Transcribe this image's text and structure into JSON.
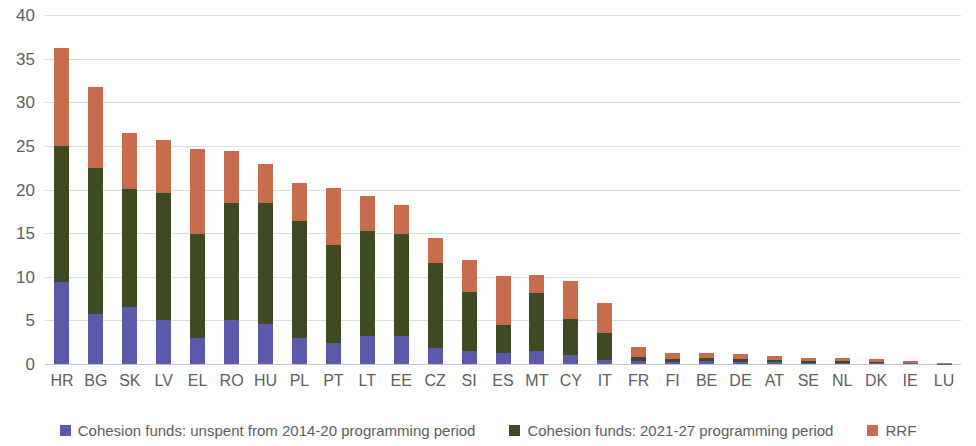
{
  "chart_data": {
    "type": "bar",
    "stacked": true,
    "title": "",
    "subtitle": "",
    "xlabel": "",
    "ylabel": "",
    "ylim": [
      0,
      40
    ],
    "yticks": [
      0,
      5,
      10,
      15,
      20,
      25,
      30,
      35,
      40
    ],
    "ytick_labels": [
      "0",
      "5",
      "10",
      "15",
      "20",
      "25",
      "30",
      "35",
      "40"
    ],
    "grid": true,
    "legend_position": "bottom",
    "categories": [
      "HR",
      "BG",
      "SK",
      "LV",
      "EL",
      "RO",
      "HU",
      "PL",
      "PT",
      "LT",
      "EE",
      "CZ",
      "SI",
      "ES",
      "MT",
      "CY",
      "IT",
      "FR",
      "FI",
      "BE",
      "DE",
      "AT",
      "SE",
      "NL",
      "DK",
      "IE",
      "LU"
    ],
    "series": [
      {
        "name": "Cohesion funds: unspent from 2014-20 programming period",
        "color": "#5c5aa8",
        "values": [
          9.4,
          5.7,
          6.5,
          5.1,
          3.0,
          5.0,
          4.6,
          3.0,
          2.4,
          3.2,
          3.2,
          1.8,
          1.5,
          1.3,
          1.5,
          1.0,
          0.5,
          0.4,
          0.25,
          0.3,
          0.25,
          0.2,
          0.12,
          0.1,
          0.1,
          0.07,
          0.02
        ]
      },
      {
        "name": "Cohesion funds: 2021-27 programming period",
        "color": "#3d4a22",
        "values": [
          15.6,
          16.8,
          13.6,
          14.5,
          11.9,
          13.4,
          13.8,
          13.4,
          11.2,
          12.0,
          11.7,
          9.8,
          6.8,
          3.2,
          6.6,
          4.2,
          3.0,
          0.45,
          0.3,
          0.4,
          0.35,
          0.3,
          0.28,
          0.2,
          0.18,
          0.1,
          0.02
        ]
      },
      {
        "name": "RRF",
        "color": "#c86c4e",
        "values": [
          11.2,
          9.2,
          6.4,
          6.1,
          9.8,
          6.0,
          4.5,
          4.4,
          6.6,
          4.1,
          3.3,
          2.9,
          3.6,
          5.6,
          2.1,
          4.3,
          3.5,
          1.15,
          0.75,
          0.6,
          0.5,
          0.4,
          0.3,
          0.35,
          0.3,
          0.23,
          0.06
        ]
      }
    ],
    "totals": [
      36.2,
      31.7,
      26.5,
      25.7,
      24.7,
      24.4,
      22.9,
      20.8,
      20.2,
      19.3,
      18.2,
      14.5,
      11.9,
      10.1,
      10.2,
      9.5,
      7.0,
      2.0,
      1.3,
      1.3,
      1.1,
      0.9,
      0.7,
      0.65,
      0.58,
      0.4,
      0.1
    ]
  },
  "legend": {
    "items": [
      {
        "label": "Cohesion funds: unspent from 2014-20 programming period",
        "color": "#5c5aa8"
      },
      {
        "label": "Cohesion funds: 2021-27 programming period",
        "color": "#3d4a22"
      },
      {
        "label": "RRF",
        "color": "#c86c4e"
      }
    ]
  },
  "colors": {
    "series_blue": "#5c5aa8",
    "series_green": "#3d4a22",
    "series_orange": "#c86c4e",
    "gridline": "#d9dde4",
    "text": "#5d5d5d",
    "background": "#ffffff"
  }
}
